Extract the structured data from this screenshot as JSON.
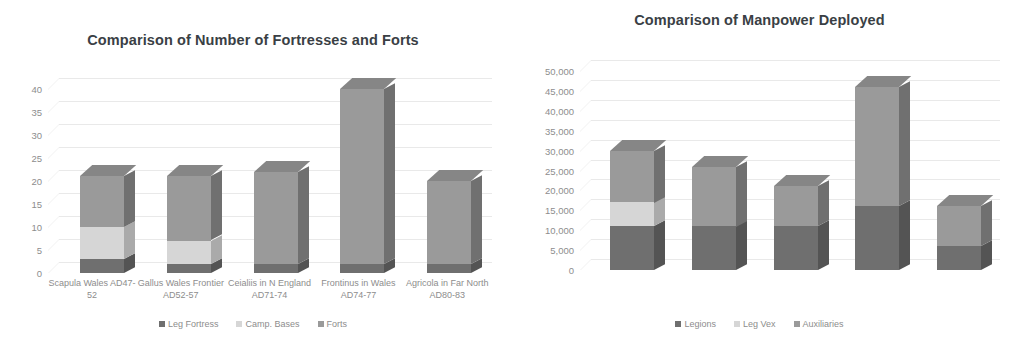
{
  "charts": [
    {
      "id": "fortresses",
      "title": "Comparison of Number of Fortresses and Forts",
      "legend": [
        {
          "label": "Leg Fortress",
          "color": "#6f6f6f"
        },
        {
          "label": "Camp. Bases",
          "color": "#d6d6d6"
        },
        {
          "label": "Forts",
          "color": "#9a9a9a"
        }
      ],
      "yticks": [
        "0",
        "5",
        "10",
        "15",
        "20",
        "25",
        "30",
        "35",
        "40"
      ],
      "categories": [
        "Scapula Wales AD47-52",
        "Gallus Wales Frontier AD52-57",
        "Ceialiis in N England AD71-74",
        "Frontinus in Wales AD74-77",
        "Agricola in Far North AD80-83"
      ]
    },
    {
      "id": "manpower",
      "title": "Comparison of Manpower Deployed",
      "legend": [
        {
          "label": "Legions",
          "color": "#6f6f6f"
        },
        {
          "label": "Leg Vex",
          "color": "#d6d6d6"
        },
        {
          "label": "Auxiliaries",
          "color": "#9a9a9a"
        }
      ],
      "yticks": [
        "0",
        "5,000",
        "10,000",
        "15,000",
        "20,000",
        "25,000",
        "30,000",
        "35,000",
        "40,000",
        "45,000",
        "50,000"
      ],
      "categories": [
        "Scapula Wales AD47-52",
        "Gallus Wales Frontier AD52-57",
        "Ceialiis in N England AD71-74",
        "Frontinus in Wales AD74-77",
        "Agricola in Far North AD80-83"
      ]
    }
  ],
  "chart_data": [
    {
      "type": "bar",
      "subtype": "stacked-column-3d",
      "title": "Comparison of Number of Fortresses and Forts",
      "xlabel": "",
      "ylabel": "",
      "ylim": [
        0,
        40
      ],
      "ytick_step": 5,
      "grid": true,
      "legend_position": "bottom",
      "categories": [
        "Scapula Wales AD47-52",
        "Gallus Wales Frontier AD52-57",
        "Ceialiis in N England AD71-74",
        "Frontinus in Wales AD74-77",
        "Agricola in Far North AD80-83"
      ],
      "series": [
        {
          "name": "Leg Fortress",
          "color": "#6f6f6f",
          "values": [
            3,
            2,
            2,
            2,
            2
          ]
        },
        {
          "name": "Camp. Bases",
          "color": "#d6d6d6",
          "values": [
            7,
            5,
            0,
            0,
            0
          ]
        },
        {
          "name": "Forts",
          "color": "#9a9a9a",
          "values": [
            11,
            14,
            20,
            38,
            18
          ]
        }
      ],
      "totals": [
        21,
        21,
        22,
        40,
        20
      ]
    },
    {
      "type": "bar",
      "subtype": "stacked-column-3d",
      "title": "Comparison of Manpower Deployed",
      "xlabel": "",
      "ylabel": "",
      "ylim": [
        0,
        50000
      ],
      "ytick_step": 5000,
      "grid": true,
      "legend_position": "bottom",
      "categories": [
        "Scapula Wales AD47-52",
        "Gallus Wales Frontier AD52-57",
        "Ceialiis in N England AD71-74",
        "Frontinus in Wales AD74-77",
        "Agricola in Far North AD80-83"
      ],
      "series": [
        {
          "name": "Legions",
          "color": "#6f6f6f",
          "values": [
            11000,
            11000,
            11000,
            16000,
            6000
          ]
        },
        {
          "name": "Leg Vex",
          "color": "#d6d6d6",
          "values": [
            6000,
            0,
            0,
            0,
            0
          ]
        },
        {
          "name": "Auxiliaries",
          "color": "#9a9a9a",
          "values": [
            13000,
            15000,
            10000,
            30000,
            10000
          ]
        }
      ],
      "totals": [
        30000,
        26000,
        21000,
        46000,
        16000
      ]
    }
  ],
  "colors": {
    "series_dark": "#6f6f6f",
    "series_light": "#d6d6d6",
    "series_mid": "#9a9a9a",
    "side_dark": "#545454",
    "side_light": "#aaaaaa",
    "side_mid": "#707070",
    "top_dark": "#5e5e5e",
    "top_light": "#c4c4c4",
    "top_mid": "#868686",
    "gridline": "#e9e9e9",
    "axis_text": "#8d8d8d",
    "title_text": "#3a3f45",
    "background": "#ffffff"
  }
}
